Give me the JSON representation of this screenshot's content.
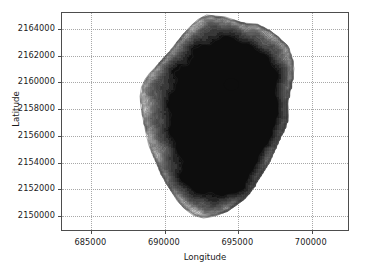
{
  "chart_data": {
    "type": "contour",
    "title": "",
    "xlabel": "Longitude",
    "ylabel": "Latitude",
    "xlim": [
      683000,
      702600
    ],
    "ylim": [
      2148800,
      2165200
    ],
    "xticks": [
      685000,
      690000,
      695000,
      700000
    ],
    "yticks": [
      2150000,
      2152000,
      2154000,
      2156000,
      2158000,
      2160000,
      2162000,
      2164000
    ],
    "xtick_labels": [
      "685000",
      "690000",
      "695000",
      "700000"
    ],
    "ytick_labels": [
      "2150000",
      "2152000",
      "2154000",
      "2156000",
      "2158000",
      "2160000",
      "2162000",
      "2164000"
    ],
    "grid": true,
    "grid_style": "dotted",
    "grid_color": "#9a9a9a",
    "colormap": "gray",
    "legend": "none",
    "background_color": "#ffffff",
    "axes_edge_color": "#4d4d4d",
    "summit_marker": {
      "x": 694600,
      "y": 2159800,
      "color": "#0d0d0d"
    },
    "fill_levels": [
      {
        "level": 0,
        "color": "#ffffff"
      },
      {
        "level": 1,
        "color": "#ededed"
      },
      {
        "level": 2,
        "color": "#d7d7d7"
      },
      {
        "level": 3,
        "color": "#bdbdbd"
      },
      {
        "level": 4,
        "color": "#a3a3a3"
      },
      {
        "level": 5,
        "color": "#8a8a8a"
      },
      {
        "level": 6,
        "color": "#747474"
      },
      {
        "level": 7,
        "color": "#616161"
      },
      {
        "level": 8,
        "color": "#4f4f4f"
      },
      {
        "level": 9,
        "color": "#3a3a3a"
      },
      {
        "level": 10,
        "color": "#222222"
      },
      {
        "level": 11,
        "color": "#0d0d0d"
      }
    ],
    "contour_line_color": "#333333"
  },
  "axis": {
    "xlabel": "Longitude",
    "ylabel": "Latitude"
  }
}
